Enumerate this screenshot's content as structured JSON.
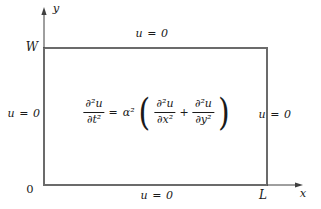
{
  "figure": {
    "axes": {
      "x_label": "x",
      "y_label": "y",
      "origin_label": "0"
    },
    "domain": {
      "height_label": "W",
      "width_label": "L"
    },
    "boundary_conditions": {
      "top": "u = 0",
      "bottom": "u = 0",
      "left": "u = 0",
      "right": "u = 0"
    },
    "equation": {
      "lhs_num": "∂²u",
      "lhs_den": "∂t²",
      "equals": "=",
      "coefficient": "α²",
      "open_paren": "(",
      "term1_num": "∂²u",
      "term1_den": "∂x²",
      "plus": "+",
      "term2_num": "∂²u",
      "term2_den": "∂y²",
      "close_paren": ")"
    }
  },
  "colors": {
    "bg": "#ffffff",
    "border": "#6b6b6b",
    "axis": "#3f3f3f",
    "text": "#1a1a1a"
  }
}
